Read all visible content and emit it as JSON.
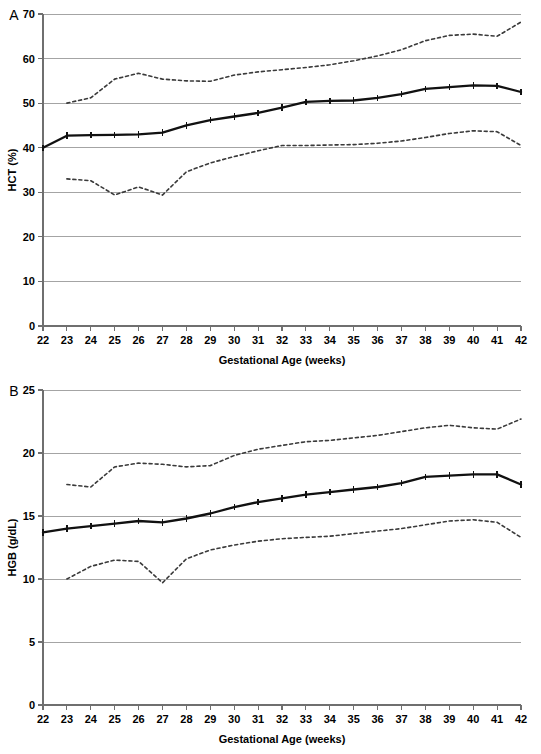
{
  "figure": {
    "panels": [
      "A",
      "B"
    ],
    "shared_xlabel": "Gestational Age (weeks)",
    "colors": {
      "median_line": "#111111",
      "percentile_line": "#3a3a3a",
      "grid": "#9a9a9a",
      "axis": "#6f6f6f",
      "background": "#ffffff"
    }
  },
  "panel_a": {
    "letter": "A",
    "ylabel": "HCT (%)",
    "xlabel": "Gestational Age (weeks)",
    "y_ticks": [
      "0",
      "10",
      "20",
      "30",
      "40",
      "50",
      "60",
      "70"
    ],
    "x_ticks": [
      "22",
      "23",
      "24",
      "25",
      "26",
      "27",
      "28",
      "29",
      "30",
      "31",
      "32",
      "33",
      "34",
      "35",
      "36",
      "37",
      "38",
      "39",
      "40",
      "41",
      "42"
    ]
  },
  "panel_b": {
    "letter": "B",
    "ylabel": "HGB (g/dL)",
    "xlabel": "Gestational Age (weeks)",
    "y_ticks": [
      "0",
      "5",
      "10",
      "15",
      "20",
      "25"
    ],
    "x_ticks": [
      "22",
      "23",
      "24",
      "25",
      "26",
      "27",
      "28",
      "29",
      "30",
      "31",
      "32",
      "33",
      "34",
      "35",
      "36",
      "37",
      "38",
      "39",
      "40",
      "41",
      "42"
    ]
  },
  "chart_data": [
    {
      "id": "panel_a",
      "type": "line",
      "title": "A",
      "xlabel": "Gestational Age (weeks)",
      "ylabel": "HCT (%)",
      "xlim": [
        22,
        42
      ],
      "ylim": [
        0,
        70
      ],
      "y_ticks": [
        0,
        10,
        20,
        30,
        40,
        50,
        60,
        70
      ],
      "x": [
        22,
        23,
        24,
        25,
        26,
        27,
        28,
        29,
        30,
        31,
        32,
        33,
        34,
        35,
        36,
        37,
        38,
        39,
        40,
        41,
        42
      ],
      "grid": true,
      "legend": "none",
      "series": [
        {
          "name": "5th percentile",
          "style": "dashed",
          "markers": false,
          "values": [
            null,
            33.0,
            32.6,
            29.4,
            31.2,
            29.4,
            34.6,
            36.6,
            38.0,
            39.3,
            40.5,
            40.5,
            40.6,
            40.7,
            41.0,
            41.5,
            42.3,
            43.2,
            43.8,
            43.6,
            40.5
          ]
        },
        {
          "name": "Median",
          "style": "solid",
          "markers": true,
          "values": [
            40.0,
            42.7,
            42.8,
            42.9,
            43.0,
            43.4,
            45.0,
            46.2,
            47.0,
            47.8,
            49.0,
            50.3,
            50.5,
            50.6,
            51.2,
            52.0,
            53.2,
            53.6,
            54.0,
            53.9,
            52.5
          ]
        },
        {
          "name": "95th percentile",
          "style": "dashed",
          "markers": false,
          "values": [
            null,
            50.0,
            51.2,
            55.4,
            56.7,
            55.4,
            55.0,
            54.9,
            56.3,
            57.0,
            57.5,
            58.0,
            58.6,
            59.5,
            60.6,
            62.0,
            64.0,
            65.2,
            65.5,
            65.0,
            68.2
          ]
        }
      ]
    },
    {
      "id": "panel_b",
      "type": "line",
      "title": "B",
      "xlabel": "Gestational Age (weeks)",
      "ylabel": "HGB (g/dL)",
      "xlim": [
        22,
        42
      ],
      "ylim": [
        0,
        25
      ],
      "y_ticks": [
        0,
        5,
        10,
        15,
        20,
        25
      ],
      "x": [
        22,
        23,
        24,
        25,
        26,
        27,
        28,
        29,
        30,
        31,
        32,
        33,
        34,
        35,
        36,
        37,
        38,
        39,
        40,
        41,
        42
      ],
      "grid": true,
      "legend": "none",
      "series": [
        {
          "name": "5th percentile",
          "style": "dashed",
          "markers": false,
          "values": [
            null,
            10.0,
            11.0,
            11.5,
            11.4,
            9.7,
            11.6,
            12.3,
            12.7,
            13.0,
            13.2,
            13.3,
            13.4,
            13.6,
            13.8,
            14.0,
            14.3,
            14.6,
            14.7,
            14.5,
            13.3
          ]
        },
        {
          "name": "Median",
          "style": "solid",
          "markers": true,
          "values": [
            13.7,
            14.0,
            14.2,
            14.4,
            14.6,
            14.5,
            14.8,
            15.2,
            15.7,
            16.1,
            16.4,
            16.7,
            16.9,
            17.1,
            17.3,
            17.6,
            18.1,
            18.2,
            18.3,
            18.3,
            17.5
          ]
        },
        {
          "name": "95th percentile",
          "style": "dashed",
          "markers": false,
          "values": [
            null,
            17.5,
            17.3,
            18.9,
            19.2,
            19.1,
            18.9,
            19.0,
            19.8,
            20.3,
            20.6,
            20.9,
            21.0,
            21.2,
            21.4,
            21.7,
            22.0,
            22.2,
            22.0,
            21.9,
            22.7
          ]
        }
      ]
    }
  ]
}
